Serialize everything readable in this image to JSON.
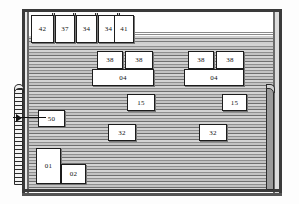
{
  "diagram": {
    "top_row": {
      "label": "top-stall-row",
      "cells": [
        {
          "id": "stall-42",
          "label": "42",
          "x": 31,
          "y": 15,
          "w": 21,
          "h": 26
        },
        {
          "id": "stall-37",
          "label": "37",
          "x": 55,
          "y": 15,
          "w": 18,
          "h": 26
        },
        {
          "id": "stall-34a",
          "label": "34",
          "x": 76,
          "y": 15,
          "w": 19,
          "h": 26
        },
        {
          "id": "stall-34b",
          "label": "34",
          "x": 98,
          "y": 15,
          "w": 19,
          "h": 26
        },
        {
          "id": "stall-41",
          "label": "41",
          "x": 114,
          "y": 15,
          "w": 18,
          "h": 26
        }
      ]
    },
    "separators": [
      {
        "x": 52,
        "y": 13,
        "h": 30
      },
      {
        "x": 73,
        "y": 13,
        "h": 30
      },
      {
        "x": 95,
        "y": 13,
        "h": 30
      },
      {
        "x": 117,
        "y": 13,
        "h": 30
      }
    ],
    "floor_items": [
      {
        "id": "item-38-1",
        "label": "38",
        "x": 97,
        "y": 51,
        "w": 24,
        "h": 16
      },
      {
        "id": "item-38-2",
        "label": "38",
        "x": 125,
        "y": 51,
        "w": 26,
        "h": 16
      },
      {
        "id": "item-38-3",
        "label": "38",
        "x": 188,
        "y": 51,
        "w": 24,
        "h": 16
      },
      {
        "id": "item-38-4",
        "label": "38",
        "x": 216,
        "y": 51,
        "w": 26,
        "h": 16
      },
      {
        "id": "item-04-left",
        "label": "04",
        "x": 92,
        "y": 69,
        "w": 60,
        "h": 15
      },
      {
        "id": "item-04-right",
        "label": "04",
        "x": 184,
        "y": 69,
        "w": 58,
        "h": 15
      },
      {
        "id": "item-15-left",
        "label": "15",
        "x": 127,
        "y": 94,
        "w": 26,
        "h": 15
      },
      {
        "id": "item-15-right",
        "label": "15",
        "x": 222,
        "y": 94,
        "w": 23,
        "h": 15
      },
      {
        "id": "item-50",
        "label": "50",
        "x": 38,
        "y": 110,
        "w": 25,
        "h": 15
      },
      {
        "id": "item-32-left",
        "label": "32",
        "x": 108,
        "y": 124,
        "w": 26,
        "h": 15
      },
      {
        "id": "item-32-right",
        "label": "32",
        "x": 199,
        "y": 124,
        "w": 26,
        "h": 15
      },
      {
        "id": "item-01",
        "label": "01",
        "x": 36,
        "y": 148,
        "w": 23,
        "h": 34
      },
      {
        "id": "item-02",
        "label": "02",
        "x": 61,
        "y": 164,
        "w": 23,
        "h": 18
      }
    ],
    "annotations": {
      "left_rail": "access-rail",
      "left_arrow": "entry-arrow",
      "right_post": "corner-post"
    }
  }
}
